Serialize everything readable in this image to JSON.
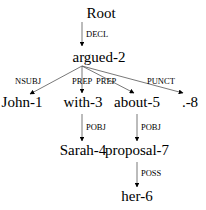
{
  "diagram": {
    "type": "dependency-tree",
    "nodes": [
      {
        "id": "root",
        "label": "Root"
      },
      {
        "id": "argued-2",
        "label": "argued-2"
      },
      {
        "id": "john-1",
        "label": "John-1"
      },
      {
        "id": "with-3",
        "label": "with-3"
      },
      {
        "id": "about-5",
        "label": "about-5"
      },
      {
        "id": "punct-8",
        "label": ".-8"
      },
      {
        "id": "sarah-4",
        "label": "Sarah-4"
      },
      {
        "id": "proposal-7",
        "label": "proposal-7"
      },
      {
        "id": "her-6",
        "label": "her-6"
      }
    ],
    "edges": [
      {
        "from": "root",
        "to": "argued-2",
        "label": "DECL"
      },
      {
        "from": "argued-2",
        "to": "john-1",
        "label": "NSUBJ"
      },
      {
        "from": "argued-2",
        "to": "with-3",
        "label": "PREP"
      },
      {
        "from": "argued-2",
        "to": "about-5",
        "label": "PREP"
      },
      {
        "from": "argued-2",
        "to": "punct-8",
        "label": "PUNCT"
      },
      {
        "from": "with-3",
        "to": "sarah-4",
        "label": "POBJ"
      },
      {
        "from": "about-5",
        "to": "proposal-7",
        "label": "POBJ"
      },
      {
        "from": "proposal-7",
        "to": "her-6",
        "label": "POSS"
      }
    ]
  }
}
